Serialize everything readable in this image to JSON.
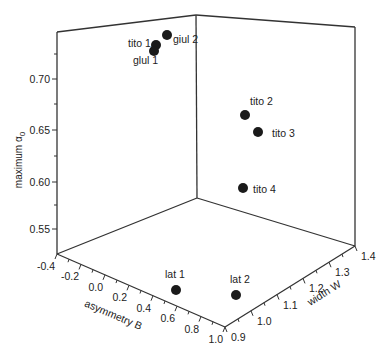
{
  "chart_data": {
    "type": "scatter",
    "dimensions": "3d",
    "title": "",
    "axes": {
      "x": {
        "label": "asymmetry B",
        "ticks": [
          "-0.4",
          "-0.2",
          "0.0",
          "0.2",
          "0.4",
          "0.6",
          "0.8",
          "1.0"
        ],
        "range": [
          -0.4,
          1.0
        ]
      },
      "y": {
        "label": "width W",
        "ticks": [
          "0.9",
          "1.0",
          "1.1",
          "1.2",
          "1.3",
          "1.4"
        ],
        "range": [
          0.9,
          1.4
        ]
      },
      "z": {
        "label": "maximum α",
        "label_subscript": "0",
        "ticks": [
          "0.55",
          "0.60",
          "0.65",
          "0.70"
        ],
        "range": [
          0.53,
          0.74
        ]
      }
    },
    "grid": false,
    "legend": null,
    "points": [
      {
        "label": "giul 2",
        "px": [
          167,
          35
        ],
        "label_px": [
          173,
          43
        ]
      },
      {
        "label": "tito 1",
        "px": [
          156,
          45
        ],
        "label_px": [
          128,
          47
        ]
      },
      {
        "label": "glul 1",
        "px": [
          154,
          51
        ],
        "label_px": [
          133,
          64
        ]
      },
      {
        "label": "tito 2",
        "px": [
          245,
          115
        ],
        "label_px": [
          250,
          105
        ]
      },
      {
        "label": "tito 3",
        "px": [
          258,
          132
        ],
        "label_px": [
          272,
          137
        ]
      },
      {
        "label": "tito 4",
        "px": [
          243,
          188
        ],
        "label_px": [
          253,
          193
        ]
      },
      {
        "label": "lat 1",
        "px": [
          176,
          290
        ],
        "label_px": [
          165,
          278
        ]
      },
      {
        "label": "lat 2",
        "px": [
          236,
          295
        ],
        "label_px": [
          230,
          283
        ]
      }
    ]
  },
  "labels": {
    "z_axis": "maximum α",
    "z_axis_sub": "0",
    "x_axis": "asymmetry B",
    "y_axis": "width W"
  }
}
